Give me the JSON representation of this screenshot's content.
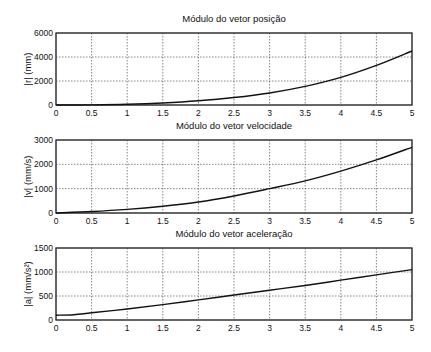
{
  "chart_data": [
    {
      "type": "line",
      "title": "Módulo do vetor posição",
      "xlabel": "",
      "ylabel": "|r| (mm)",
      "xlim": [
        0,
        5
      ],
      "ylim": [
        0,
        6000
      ],
      "xticks": [
        "0",
        "0.5",
        "1",
        "1.5",
        "2",
        "2.5",
        "3",
        "3.5",
        "4",
        "4.5",
        "5"
      ],
      "yticks": [
        "0",
        "2000",
        "4000",
        "6000"
      ],
      "grid": true,
      "x": [
        0,
        0.5,
        1,
        1.5,
        2,
        2.5,
        3,
        3.5,
        4,
        4.5,
        5
      ],
      "series": [
        {
          "name": "|r|",
          "values": [
            0,
            10,
            60,
            170,
            350,
            620,
            1000,
            1550,
            2300,
            3300,
            4500
          ]
        }
      ]
    },
    {
      "type": "line",
      "title": "Módulo do vetor velocidade",
      "xlabel": "",
      "ylabel": "|v| (mm/s)",
      "xlim": [
        0,
        5
      ],
      "ylim": [
        0,
        3000
      ],
      "xticks": [
        "0",
        "0.5",
        "1",
        "1.5",
        "2",
        "2.5",
        "3",
        "3.5",
        "4",
        "4.5",
        "5"
      ],
      "yticks": [
        "0",
        "1000",
        "2000",
        "3000"
      ],
      "grid": true,
      "x": [
        0,
        0.5,
        1,
        1.5,
        2,
        2.5,
        3,
        3.5,
        4,
        4.5,
        5
      ],
      "series": [
        {
          "name": "|v|",
          "values": [
            0,
            60,
            150,
            280,
            450,
            700,
            1000,
            1320,
            1720,
            2180,
            2700
          ]
        }
      ]
    },
    {
      "type": "line",
      "title": "Módulo do vetor aceleração",
      "xlabel": "",
      "ylabel": "|a| (mm/s²)",
      "xlim": [
        0,
        5
      ],
      "ylim": [
        0,
        1500
      ],
      "xticks": [
        "0",
        "0.5",
        "1",
        "1.5",
        "2",
        "2.5",
        "3",
        "3.5",
        "4",
        "4.5",
        "5"
      ],
      "yticks": [
        "0",
        "500",
        "1000",
        "1500"
      ],
      "grid": true,
      "x": [
        0,
        0.25,
        0.5,
        1,
        1.5,
        2,
        2.5,
        3,
        3.5,
        4,
        4.5,
        5
      ],
      "series": [
        {
          "name": "|a|",
          "values": [
            100,
            110,
            150,
            230,
            320,
            420,
            520,
            620,
            720,
            830,
            940,
            1050
          ]
        }
      ]
    }
  ]
}
